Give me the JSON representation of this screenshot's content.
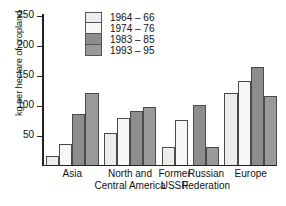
{
  "chart_data": {
    "type": "bar",
    "title": "",
    "xlabel": "",
    "ylabel": "kg per hectare of cropland",
    "ylim": [
      0,
      250
    ],
    "yticks": [
      50,
      100,
      150,
      200,
      250
    ],
    "grid": false,
    "legend_position": "top-center",
    "categories": [
      "Asia",
      "North and Central America",
      "Former USSR",
      "Russian Federation",
      "Europe"
    ],
    "series": [
      {
        "name": "1964 – 66",
        "color": "#ededeb",
        "values": [
          15,
          52,
          29,
          null,
          120
        ]
      },
      {
        "name": "1974 – 76",
        "color": "#f7f7f5",
        "values": [
          35,
          78,
          74,
          null,
          140
        ]
      },
      {
        "name": "1983 – 85",
        "color": "#8d8d8d",
        "values": [
          85,
          89,
          null,
          100,
          162
        ]
      },
      {
        "name": "1993 – 95",
        "color": "#9a9a9a",
        "values": [
          120,
          96,
          null,
          29,
          115
        ]
      }
    ]
  },
  "axis": {
    "y_title": "kg per hectare of cropland",
    "tick_250": "250",
    "tick_200": "200",
    "tick_150": "150",
    "tick_100": "100",
    "tick_50": "50"
  },
  "legend": {
    "items": [
      {
        "label": "1964 – 66"
      },
      {
        "label": "1974 – 76"
      },
      {
        "label": "1983 – 85"
      },
      {
        "label": "1993 – 95"
      }
    ]
  },
  "x_labels": [
    {
      "line1": "Asia",
      "line2": ""
    },
    {
      "line1": "North and",
      "line2": "Central America"
    },
    {
      "line1": "Former",
      "line2": "USSR"
    },
    {
      "line1": "Russian",
      "line2": "Federation"
    },
    {
      "line1": "Europe",
      "line2": ""
    }
  ]
}
